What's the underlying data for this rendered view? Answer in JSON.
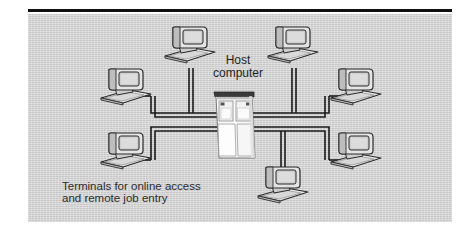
{
  "figure": {
    "kind": "network-topology-diagram",
    "background_color": "#d2d2d2",
    "page_background": "#ffffff",
    "rule_color": "#101010",
    "line_color": "#1a1a1a",
    "terminal_fill": "#e8e8e8",
    "terminal_shade": "#b8b8b8",
    "screen_fill": "#cfcfcf",
    "server_fill": "#f7f7f7",
    "server_top_color": "#3a3a3a"
  },
  "labels": {
    "host_line_1": "Host",
    "host_line_2": "computer",
    "caption_line_1": "Terminals for online access",
    "caption_line_2": "and remote job entry"
  },
  "diagram_data": {
    "type": "diagram",
    "topology": "star-bus hybrid: central host computer with dual communication bus lines serving eight terminals",
    "center_node": {
      "name": "host-computer",
      "label": "Host computer",
      "shape": "mainframe-cabinet",
      "x": 236,
      "y": 128
    },
    "bus_lines": [
      {
        "name": "upper-bus",
        "y": 113,
        "x_start": 155,
        "x_end": 325,
        "style": "double-line"
      },
      {
        "name": "lower-bus",
        "y": 127,
        "x_start": 155,
        "x_end": 325,
        "style": "double-line"
      }
    ],
    "terminals": [
      {
        "id": "terminal-top-left",
        "label": "terminal",
        "x": 185,
        "y": 48,
        "connects_to": "upper-bus",
        "connector": "vertical-riser"
      },
      {
        "id": "terminal-top-right",
        "label": "terminal",
        "x": 288,
        "y": 48,
        "connects_to": "upper-bus",
        "connector": "vertical-riser"
      },
      {
        "id": "terminal-left-upper",
        "label": "terminal",
        "x": 122,
        "y": 90,
        "connects_to": "upper-bus",
        "connector": "elbow"
      },
      {
        "id": "terminal-left-lower",
        "label": "terminal",
        "x": 122,
        "y": 155,
        "connects_to": "lower-bus",
        "connector": "elbow"
      },
      {
        "id": "terminal-right-upper",
        "label": "terminal",
        "x": 350,
        "y": 90,
        "connects_to": "upper-bus",
        "connector": "elbow"
      },
      {
        "id": "terminal-right-lower",
        "label": "terminal",
        "x": 350,
        "y": 155,
        "connects_to": "lower-bus",
        "connector": "elbow"
      },
      {
        "id": "terminal-bottom-center",
        "label": "terminal",
        "x": 278,
        "y": 185,
        "connects_to": "lower-bus",
        "connector": "vertical-riser"
      }
    ],
    "annotations": [
      {
        "name": "host-label",
        "text": "Host computer",
        "x": 238,
        "y": 60
      },
      {
        "name": "caption-label",
        "text": "Terminals for online access and remote job entry",
        "x": 62,
        "y": 186
      }
    ]
  }
}
